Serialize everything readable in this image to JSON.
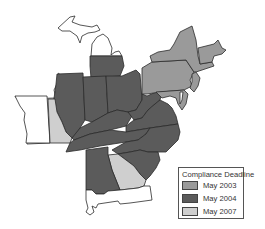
{
  "map": {
    "region": "Eastern United States",
    "colors": {
      "may_2003": "#9a9a9a",
      "may_2004": "#5b5b5b",
      "may_2007": "#cfcfcf",
      "excluded": "#ffffff",
      "border": "#2b2b2b"
    }
  },
  "legend": {
    "title": "Compliance Deadline",
    "items": [
      {
        "label": "May 2003",
        "color": "#9a9a9a"
      },
      {
        "label": "May 2004",
        "color": "#5b5b5b"
      },
      {
        "label": "May 2007",
        "color": "#cfcfcf"
      }
    ]
  }
}
